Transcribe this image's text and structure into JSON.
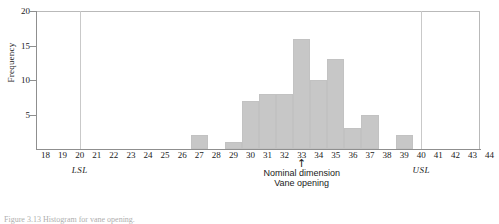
{
  "chart_data": {
    "type": "bar",
    "title": "",
    "subtitle": "",
    "xlabel": "Nominal dimension",
    "xlabel2": "Vane opening",
    "ylabel": "Frequency",
    "categories": [
      18,
      19,
      20,
      21,
      22,
      23,
      24,
      25,
      26,
      27,
      28,
      29,
      30,
      31,
      32,
      33,
      34,
      35,
      36,
      37,
      38,
      39,
      40,
      41,
      42,
      43,
      44
    ],
    "values": [
      0,
      0,
      0,
      0,
      0,
      0,
      0,
      0,
      0,
      2,
      0,
      1,
      7,
      8,
      8,
      16,
      10,
      13,
      3,
      5,
      0,
      2,
      0,
      0,
      0,
      0,
      0
    ],
    "xlim": [
      18,
      44
    ],
    "ylim": [
      0,
      20
    ],
    "ytick_values": [
      5,
      10,
      15,
      20
    ],
    "xtick_labels": [
      "18",
      "19",
      "20",
      "21",
      "22",
      "23",
      "24",
      "25",
      "26",
      "27",
      "28",
      "29",
      "30",
      "31",
      "32",
      "33",
      "34",
      "35",
      "36",
      "37",
      "38",
      "39",
      "40",
      "41",
      "42",
      "43",
      "44"
    ],
    "grid": false,
    "legend": "none",
    "bar_color": "#c7c7c7",
    "axis_color": "#8f8f8f",
    "annotations": [
      {
        "name": "lsl",
        "label": "LSL",
        "x": 20,
        "style": "vertical-reference-line"
      },
      {
        "name": "usl",
        "label": "USL",
        "x": 40,
        "style": "vertical-reference-line"
      },
      {
        "name": "nominal",
        "label": "Nominal dimension",
        "label2": "Vane opening",
        "x": 33,
        "style": "arrow-up"
      }
    ]
  },
  "axes": {
    "y_title": "Frequency",
    "y_ticks": [
      {
        "value": 20,
        "label": "20"
      },
      {
        "value": 15,
        "label": "15"
      },
      {
        "value": 10,
        "label": "10"
      },
      {
        "value": 5,
        "label": "5"
      }
    ]
  },
  "annotations": {
    "lsl_label": "LSL",
    "usl_label": "USL",
    "nominal_arrow": "↑",
    "nominal_line1": "Nominal dimension",
    "nominal_line2": "Vane opening"
  },
  "caption": {
    "text": "Figure 3.13   Histogram for vane opening."
  }
}
